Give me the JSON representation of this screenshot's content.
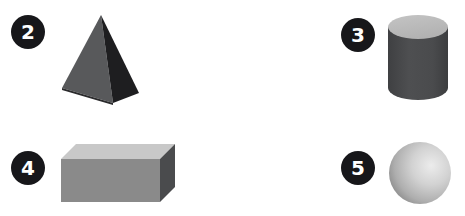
{
  "canvas": {
    "width": 465,
    "height": 216,
    "background": "#ffffff"
  },
  "badge_style": {
    "fill": "#17171a",
    "text_color": "#ffffff",
    "shape": "circle"
  },
  "items": [
    {
      "number": "2",
      "shape_name": "pyramid",
      "shape_label": "gray square pyramid",
      "colors": {
        "left_face": "#58595b",
        "right_face": "#1e1e20",
        "base_edge": "#2a2a2c"
      }
    },
    {
      "number": "3",
      "shape_name": "cylinder",
      "shape_label": "dark gray cylinder",
      "colors": {
        "top_face": "#bdbdbd",
        "body": "#4a4b4d",
        "body_shade": "#3c3d3f"
      }
    },
    {
      "number": "4",
      "shape_name": "box",
      "shape_label": "gray rectangular box",
      "colors": {
        "top_face": "#c8c8c8",
        "front_face": "#8a8a8a",
        "side_face": "#4a4b4d"
      }
    },
    {
      "number": "5",
      "shape_name": "sphere",
      "shape_label": "light gray sphere",
      "colors": {
        "highlight": "#e8e8e8",
        "mid": "#b4b4b4",
        "shadow": "#7c7c7c"
      }
    }
  ]
}
